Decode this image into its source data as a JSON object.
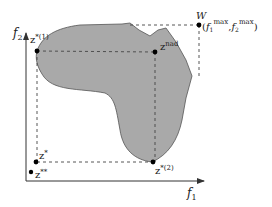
{
  "diagram": {
    "type": "multi-objective-feasible-region",
    "axes": {
      "x_label": "f",
      "x_label_sub": "1",
      "y_label": "f",
      "y_label_sub": "2"
    },
    "points": {
      "z_star_1": {
        "base": "z",
        "sup": "*(1)"
      },
      "z_nad": {
        "base": "z",
        "sup": "nad"
      },
      "W": {
        "name": "W",
        "coord_open": "(",
        "f1": "f",
        "f1_sub": "1",
        "f1_sup": "max",
        "sep": ",",
        "f2": "f",
        "f2_sub": "2",
        "f2_sup": "max",
        "coord_close": ")"
      },
      "z_star_2": {
        "base": "z",
        "sup": "*(2)"
      },
      "z_star": {
        "base": "z",
        "sup": "*"
      },
      "z_star_star": {
        "base": "z",
        "sup": "**"
      }
    },
    "colors": {
      "region_fill": "#a9a9a9",
      "region_stroke": "#555555",
      "axis": "#333333",
      "dashed": "#444444",
      "point": "#000000"
    }
  }
}
